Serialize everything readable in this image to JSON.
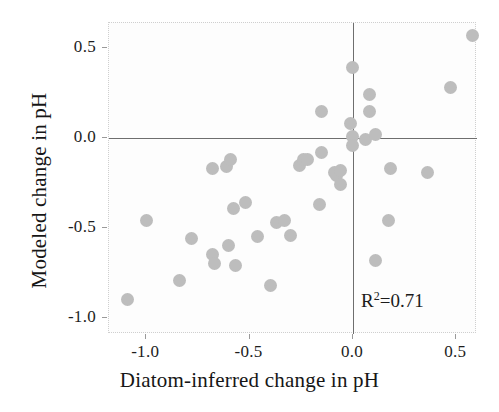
{
  "chart_data": {
    "type": "scatter",
    "title": "",
    "xlabel": "Diatom-inferred change in pH",
    "ylabel": "Modeled change in pH",
    "xlim": [
      -1.18,
      0.6
    ],
    "ylim": [
      -1.09,
      0.64
    ],
    "xticks": [
      -1.0,
      -0.5,
      0.0,
      0.5
    ],
    "xticklabels": [
      "-1.0",
      "-0.5",
      "0.0",
      "0.5"
    ],
    "yticks": [
      0.5,
      0.0,
      -0.5,
      -1.0
    ],
    "yticklabels": [
      "0.5",
      "0.0",
      "-0.5",
      "-1.0"
    ],
    "grid": false,
    "legend": null,
    "reference_lines": {
      "x": 0.0,
      "y": 0.0
    },
    "marker": {
      "shape": "circle",
      "color": "#bdbdbd",
      "size": 13
    },
    "annotations": [
      {
        "name": "r-squared",
        "text": "R2=0.71",
        "prefix": "R",
        "exponent": "2",
        "suffix": "=0.71",
        "x": 0.15,
        "y": -0.88
      }
    ],
    "points": [
      {
        "x": -1.09,
        "y": -0.9
      },
      {
        "x": -1.0,
        "y": -0.46
      },
      {
        "x": -0.84,
        "y": -0.79
      },
      {
        "x": -0.78,
        "y": -0.56
      },
      {
        "x": -0.68,
        "y": -0.17
      },
      {
        "x": -0.68,
        "y": -0.65
      },
      {
        "x": -0.67,
        "y": -0.7
      },
      {
        "x": -0.61,
        "y": -0.16
      },
      {
        "x": -0.59,
        "y": -0.12
      },
      {
        "x": -0.6,
        "y": -0.6
      },
      {
        "x": -0.58,
        "y": -0.39
      },
      {
        "x": -0.57,
        "y": -0.71
      },
      {
        "x": -0.52,
        "y": -0.36
      },
      {
        "x": -0.46,
        "y": -0.55
      },
      {
        "x": -0.4,
        "y": -0.82
      },
      {
        "x": -0.37,
        "y": -0.47
      },
      {
        "x": -0.33,
        "y": -0.46
      },
      {
        "x": -0.3,
        "y": -0.54
      },
      {
        "x": -0.26,
        "y": -0.15
      },
      {
        "x": -0.24,
        "y": -0.12
      },
      {
        "x": -0.22,
        "y": -0.12
      },
      {
        "x": -0.15,
        "y": 0.15
      },
      {
        "x": -0.15,
        "y": -0.08
      },
      {
        "x": -0.16,
        "y": -0.37
      },
      {
        "x": -0.09,
        "y": -0.19
      },
      {
        "x": -0.08,
        "y": -0.21
      },
      {
        "x": -0.06,
        "y": -0.18
      },
      {
        "x": -0.06,
        "y": -0.26
      },
      {
        "x": 0.0,
        "y": 0.39
      },
      {
        "x": -0.01,
        "y": 0.08
      },
      {
        "x": 0.0,
        "y": 0.01
      },
      {
        "x": 0.0,
        "y": -0.04
      },
      {
        "x": 0.08,
        "y": 0.24
      },
      {
        "x": 0.08,
        "y": 0.15
      },
      {
        "x": 0.06,
        "y": -0.01
      },
      {
        "x": 0.11,
        "y": 0.02
      },
      {
        "x": 0.11,
        "y": -0.68
      },
      {
        "x": 0.18,
        "y": -0.17
      },
      {
        "x": 0.17,
        "y": -0.46
      },
      {
        "x": 0.36,
        "y": -0.19
      },
      {
        "x": 0.47,
        "y": 0.28
      },
      {
        "x": 0.58,
        "y": 0.57
      }
    ]
  }
}
